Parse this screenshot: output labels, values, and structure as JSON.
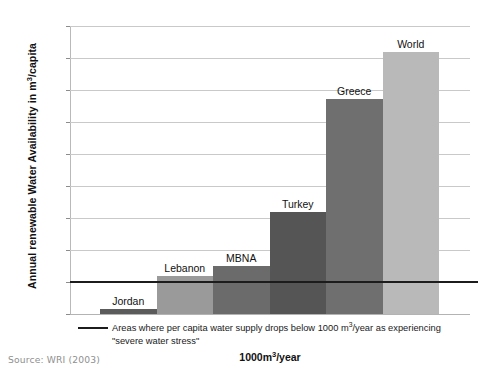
{
  "chart_data": {
    "type": "bar",
    "title": "",
    "subtitle": "",
    "categories": [
      "Jordan",
      "Lebanon",
      "MBNA",
      "Turkey",
      "Greece",
      "World"
    ],
    "values": [
      150,
      1200,
      1500,
      3180,
      6730,
      8180
    ],
    "xlabel": "1000m³/year",
    "ylabel": "Annual renewable Water Availability in m³/capita",
    "ylim": [
      0,
      9000
    ],
    "ytick_values": [
      0,
      1000,
      2000,
      3000,
      4000,
      5000,
      6000,
      7000,
      8000,
      9000
    ],
    "ytick_labels": [
      "0",
      "1000",
      "2000",
      "3000",
      "4000",
      "5000",
      "6000",
      "7000",
      "8000",
      "9000"
    ],
    "grid": true,
    "legend_position": "below-axis",
    "bar_colors": [
      "#5b5b5b",
      "#9a9a9a",
      "#6b6b6b",
      "#555555",
      "#6f6f6f",
      "#b9b9b9"
    ],
    "annotations": [
      {
        "type": "hline",
        "value": 1000,
        "color": "#1c1c1c",
        "label": "Areas where per capita water supply drops below 1000 m³/year as experiencing \"severe water stress\""
      }
    ]
  },
  "axis": {
    "y_title_main": "Annual renewable Water Availability in m",
    "y_title_sup": "3",
    "y_title_tail": "/capita",
    "x_title_main": "1000m",
    "x_title_sup": "3",
    "x_title_tail": "/year"
  },
  "caption": {
    "line1_a": "Areas where per capita water supply drops below 1000 m",
    "line1_sup": "3",
    "line1_b": "/year as experiencing",
    "line2": "\"severe water stress\""
  },
  "source": {
    "text": "Source: WRI (2003)"
  },
  "colors": {
    "gridline": "#c9c9c9",
    "threshold": "#1c1c1c",
    "text": "#1a1a1a",
    "source_text": "#8f8f8f",
    "background": "#ffffff"
  }
}
